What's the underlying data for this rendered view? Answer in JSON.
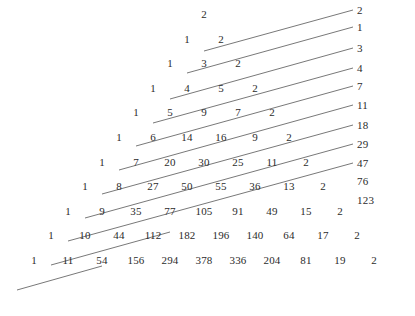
{
  "figure": {
    "background_color": "#ffffff",
    "text_color": "#2b2b2b",
    "line_color": "#555555"
  },
  "chart_data": {
    "type": "table",
    "title": "",
    "xlabel": "",
    "ylabel": "",
    "grid": false,
    "legend": "none",
    "rows": [
      {
        "index": 0,
        "values": [
          2
        ]
      },
      {
        "index": 1,
        "values": [
          1,
          2
        ]
      },
      {
        "index": 2,
        "values": [
          1,
          3,
          2
        ]
      },
      {
        "index": 3,
        "values": [
          1,
          4,
          5,
          2
        ]
      },
      {
        "index": 4,
        "values": [
          1,
          5,
          9,
          7,
          2
        ]
      },
      {
        "index": 5,
        "values": [
          1,
          6,
          14,
          16,
          9,
          2
        ]
      },
      {
        "index": 6,
        "values": [
          1,
          7,
          20,
          30,
          25,
          11,
          2
        ]
      },
      {
        "index": 7,
        "values": [
          1,
          8,
          27,
          50,
          55,
          36,
          13,
          2
        ]
      },
      {
        "index": 8,
        "values": [
          1,
          9,
          35,
          77,
          105,
          91,
          49,
          15,
          2
        ]
      },
      {
        "index": 9,
        "values": [
          1,
          10,
          44,
          112,
          182,
          196,
          140,
          64,
          17,
          2
        ]
      },
      {
        "index": 10,
        "values": [
          1,
          11,
          54,
          156,
          294,
          378,
          336,
          204,
          81,
          19,
          2
        ]
      }
    ],
    "diagonal_sums_label": "Lucas numbers",
    "diagonal_sums": [
      2,
      1,
      3,
      4,
      7,
      11,
      18,
      29,
      47,
      76,
      123
    ]
  }
}
